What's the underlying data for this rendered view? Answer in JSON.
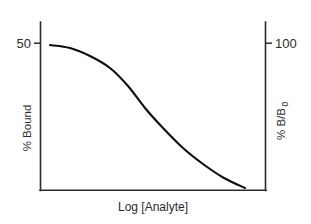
{
  "chart_data": {
    "type": "line",
    "title": "",
    "subtitle": "",
    "xlabel": "Log [Analyte]",
    "ylabel": "% Bound",
    "y2label_main": "% B/B",
    "y2label_sub": "0",
    "y2label_full": "% B/B0",
    "left_axis": {
      "label": "% Bound",
      "ticks": [
        "50"
      ],
      "tick_values": [
        50
      ],
      "tick_positions_px": [
        43
      ]
    },
    "right_axis": {
      "label": "% B/B0",
      "ticks": [
        "100"
      ],
      "tick_values": [
        100
      ],
      "tick_positions_px": [
        43
      ]
    },
    "grid": false,
    "legend": "none",
    "series": [
      {
        "name": "standard curve",
        "color": "#0d0d0d",
        "x": [
          0,
          0.1,
          0.2,
          0.3,
          0.4,
          0.5,
          0.6,
          0.7,
          0.8,
          0.9,
          1.0
        ],
        "y": [
          100,
          97,
          92,
          83,
          70,
          56,
          43,
          32,
          24,
          18,
          14
        ],
        "points_px": [
          [
            50,
            45
          ],
          [
            70,
            48
          ],
          [
            90,
            56
          ],
          [
            110,
            68
          ],
          [
            128,
            86
          ],
          [
            145,
            108
          ],
          [
            163,
            128
          ],
          [
            183,
            148
          ],
          [
            203,
            164
          ],
          [
            224,
            178
          ],
          [
            245,
            188
          ]
        ]
      }
    ],
    "axis_frame": {
      "left_px": 40,
      "right_px": 266,
      "bottom_px": 190,
      "top_px": 22,
      "top_border": false
    },
    "colors": {
      "background": "#ffffff",
      "axis": "#2b2b2b",
      "curve": "#0d0d0d",
      "text": "#2b2b2b"
    }
  },
  "figure": {
    "left_tick_label": "50",
    "right_tick_label": "100",
    "left_axis_title": "% Bound",
    "right_axis_title_main": "% B/B",
    "right_axis_title_sub": "0",
    "x_axis_title": "Log [Analyte]"
  }
}
